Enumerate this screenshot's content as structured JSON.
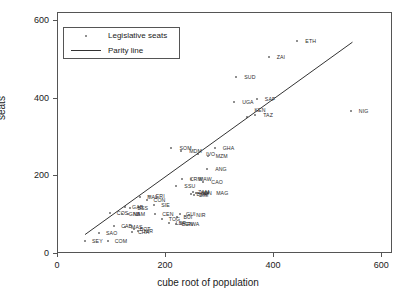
{
  "chart_data": {
    "type": "scatter",
    "title": "",
    "xlabel": "cube root of population",
    "ylabel": "seats",
    "xlim": [
      0,
      620
    ],
    "ylim": [
      0,
      620
    ],
    "xticks": [
      0,
      200,
      400,
      600
    ],
    "yticks": [
      0,
      200,
      400,
      600
    ],
    "grid": false,
    "legend_position": "upper-left",
    "legend": [
      {
        "label": "Legislative seats",
        "marker": "dot"
      },
      {
        "label": "Parity line",
        "marker": "line"
      }
    ],
    "series": [
      {
        "name": "Legislative seats",
        "marker": "dot",
        "color": "#6b6b6b",
        "points": [
          {
            "label": "ETH",
            "x": 443,
            "y": 548,
            "lx": 8,
            "ly": 0
          },
          {
            "label": "ZAI",
            "x": 390,
            "y": 508,
            "lx": 8,
            "ly": 0
          },
          {
            "label": "SUD",
            "x": 330,
            "y": 455,
            "lx": 8,
            "ly": 0
          },
          {
            "label": "SAF",
            "x": 368,
            "y": 400,
            "lx": 8,
            "ly": 0
          },
          {
            "label": "UGA",
            "x": 326,
            "y": 390,
            "lx": 8,
            "ly": 0
          },
          {
            "label": "TAZ",
            "x": 365,
            "y": 357,
            "lx": 8,
            "ly": 0
          },
          {
            "label": "KEN",
            "x": 349,
            "y": 352,
            "lx": 8,
            "ly": -7
          },
          {
            "label": "NIG",
            "x": 542,
            "y": 367,
            "lx": 8,
            "ly": 0
          },
          {
            "label": "GHA",
            "x": 290,
            "y": 272,
            "lx": 8,
            "ly": 0
          },
          {
            "label": "SOM",
            "x": 210,
            "y": 272,
            "lx": 8,
            "ly": 0
          },
          {
            "label": "MDM",
            "x": 228,
            "y": 266,
            "lx": 8,
            "ly": 0
          },
          {
            "label": "IVO",
            "x": 259,
            "y": 257,
            "lx": 8,
            "ly": 0
          },
          {
            "label": "MZM",
            "x": 277,
            "y": 252,
            "lx": 8,
            "ly": 0
          },
          {
            "label": "ANG",
            "x": 276,
            "y": 218,
            "lx": 8,
            "ly": 0
          },
          {
            "label": "CRM",
            "x": 229,
            "y": 192,
            "lx": 8,
            "ly": 0
          },
          {
            "label": "MAW",
            "x": 246,
            "y": 194,
            "lx": 8,
            "ly": 0
          },
          {
            "label": "CAO",
            "x": 269,
            "y": 185,
            "lx": 8,
            "ly": 0
          },
          {
            "label": "SSU",
            "x": 219,
            "y": 176,
            "lx": 8,
            "ly": 0
          },
          {
            "label": "MAG",
            "x": 278,
            "y": 158,
            "lx": 8,
            "ly": 0
          },
          {
            "label": "ZAM",
            "x": 250,
            "y": 160,
            "lx": 5,
            "ly": 0
          },
          {
            "label": "SEN",
            "x": 255,
            "y": 156,
            "lx": 5,
            "ly": 0
          },
          {
            "label": "BUR",
            "x": 247,
            "y": 154,
            "lx": 5,
            "ly": 0
          },
          {
            "label": "ZIM",
            "x": 252,
            "y": 152,
            "lx": 5,
            "ly": 0
          },
          {
            "label": "MAL",
            "x": 152,
            "y": 147,
            "lx": 7,
            "ly": 0
          },
          {
            "label": "ERI",
            "x": 168,
            "y": 148,
            "lx": 7,
            "ly": 0
          },
          {
            "label": "CON",
            "x": 164,
            "y": 138,
            "lx": 7,
            "ly": 0
          },
          {
            "label": "SIE",
            "x": 178,
            "y": 126,
            "lx": 7,
            "ly": 0
          },
          {
            "label": "GAB",
            "x": 124,
            "y": 120,
            "lx": 7,
            "ly": 0
          },
          {
            "label": "BSS",
            "x": 134,
            "y": 118,
            "lx": 7,
            "ly": 0
          },
          {
            "label": "CEN",
            "x": 180,
            "y": 103,
            "lx": 7,
            "ly": 0
          },
          {
            "label": "COS",
            "x": 96,
            "y": 105,
            "lx": 7,
            "ly": 0
          },
          {
            "label": "GNB",
            "x": 118,
            "y": 104,
            "lx": 7,
            "ly": 0
          },
          {
            "label": "NAM",
            "x": 130,
            "y": 102,
            "lx": 5,
            "ly": 0
          },
          {
            "label": "GUI",
            "x": 226,
            "y": 103,
            "lx": 6,
            "ly": 0
          },
          {
            "label": "NIR",
            "x": 243,
            "y": 100,
            "lx": 7,
            "ly": 0
          },
          {
            "label": "BUI",
            "x": 221,
            "y": 96,
            "lx": 6,
            "ly": 0
          },
          {
            "label": "TOG",
            "x": 192,
            "y": 90,
            "lx": 7,
            "ly": 0
          },
          {
            "label": "LBR",
            "x": 205,
            "y": 80,
            "lx": 7,
            "ly": 0
          },
          {
            "label": "BEN",
            "x": 218,
            "y": 78,
            "lx": 6,
            "ly": 0
          },
          {
            "label": "RWA",
            "x": 228,
            "y": 76,
            "lx": 6,
            "ly": 0
          },
          {
            "label": "CAB",
            "x": 104,
            "y": 72,
            "lx": 7,
            "ly": 0
          },
          {
            "label": "MAS",
            "x": 124,
            "y": 70,
            "lx": 6,
            "ly": 0
          },
          {
            "label": "BOT",
            "x": 140,
            "y": 64,
            "lx": 6,
            "ly": 0
          },
          {
            "label": "CHA",
            "x": 137,
            "y": 56,
            "lx": 6,
            "ly": 0
          },
          {
            "label": "NIR2",
            "x": 148,
            "y": 58,
            "lx": 6,
            "ly": 0
          },
          {
            "label": "SAO",
            "x": 76,
            "y": 55,
            "lx": 7,
            "ly": 0
          },
          {
            "label": "SEY",
            "x": 50,
            "y": 33,
            "lx": 7,
            "ly": 0
          },
          {
            "label": "COM",
            "x": 92,
            "y": 33,
            "lx": 7,
            "ly": 0
          }
        ]
      }
    ],
    "parity_line": {
      "name": "Parity line",
      "color": "#333333",
      "x0": 50,
      "y0": 50,
      "x1": 545,
      "y1": 545
    }
  }
}
